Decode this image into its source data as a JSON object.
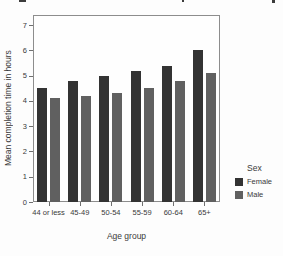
{
  "chart_data": {
    "type": "bar",
    "title": "",
    "categories": [
      "44 or less",
      "45-49",
      "50-54",
      "55-59",
      "60-64",
      "65+"
    ],
    "series": [
      {
        "name": "Female",
        "color": "#333333",
        "values": [
          4.5,
          4.8,
          5.0,
          5.2,
          5.4,
          6.0
        ]
      },
      {
        "name": "Male",
        "color": "#606060",
        "values": [
          4.1,
          4.2,
          4.3,
          4.5,
          4.8,
          5.1
        ]
      }
    ],
    "xlabel": "Age group",
    "ylabel": "Mean completion time in hours",
    "ylim": [
      0,
      7.4
    ],
    "yticks": [
      0,
      1,
      2,
      3,
      4,
      5,
      6,
      7
    ],
    "grid": false,
    "legend_title": "Sex",
    "legend_position": "right"
  }
}
